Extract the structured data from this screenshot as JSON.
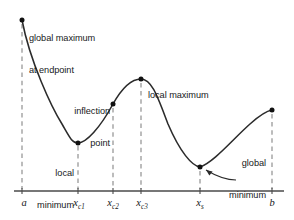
{
  "figure": {
    "background_color": "#ffffff",
    "curve_color": "#2b2b2b",
    "axis_color": "#4a4a4a",
    "dash_color": "#8c8c8c",
    "point_color": "#111111"
  },
  "axis": {
    "y_pixel": 191,
    "x_start": 14,
    "x_end": 284,
    "tick_labels": [
      {
        "id": "a",
        "text": "a",
        "sub": "",
        "x": 24
      },
      {
        "id": "xc1",
        "text": "x",
        "sub": "c1",
        "x": 79
      },
      {
        "id": "xc2",
        "text": "x",
        "sub": "c2",
        "x": 113
      },
      {
        "id": "xc3",
        "text": "x",
        "sub": "c3",
        "x": 142
      },
      {
        "id": "xs",
        "text": "x",
        "sub": "s",
        "x": 200
      },
      {
        "id": "b",
        "text": "b",
        "sub": "",
        "x": 272
      }
    ]
  },
  "annotations": {
    "global_max": {
      "line1": "global maximum",
      "line2": "at endpoint"
    },
    "inflection": {
      "line1": "inflection",
      "line2": "point"
    },
    "local_max": {
      "line1": "local maximum"
    },
    "local_min": {
      "line1": "local",
      "line2": "minimum"
    },
    "global_min": {
      "line1": "global",
      "line2": "minimum",
      "line3": "singular",
      "line4": "point"
    }
  },
  "chart_data": {
    "type": "line",
    "title": "",
    "xlabel": "",
    "ylabel": "",
    "grid": false,
    "legend": "none",
    "x_tick_labels": [
      "a",
      "x_c1",
      "x_c2",
      "x_c3",
      "x_s",
      "b"
    ],
    "x_tick_pixels": [
      22,
      78,
      113,
      141,
      200,
      272
    ],
    "marked_points": [
      {
        "name": "global maximum at endpoint",
        "x_label": "a",
        "px": 22,
        "py": 20
      },
      {
        "name": "local minimum",
        "x_label": "x_c1",
        "px": 78,
        "py": 143
      },
      {
        "name": "inflection point",
        "x_label": "x_c2",
        "px": 113,
        "py": 104
      },
      {
        "name": "local maximum",
        "x_label": "x_c3",
        "px": 141,
        "py": 79
      },
      {
        "name": "global minimum singular point",
        "x_label": "x_s",
        "px": 200,
        "py": 167
      },
      {
        "name": "right endpoint",
        "x_label": "b",
        "px": 272,
        "py": 110
      }
    ],
    "curve_path": "M22,20 C30,62 52,108 62,124 C70,138 72,143 78,143 C86,143 100,128 113,104 C122,88 131,79 141,79 C152,79 158,98 168,124 C180,152 192,166 200,167 C214,162 232,140 250,124 C260,115 266,111 272,110"
  }
}
